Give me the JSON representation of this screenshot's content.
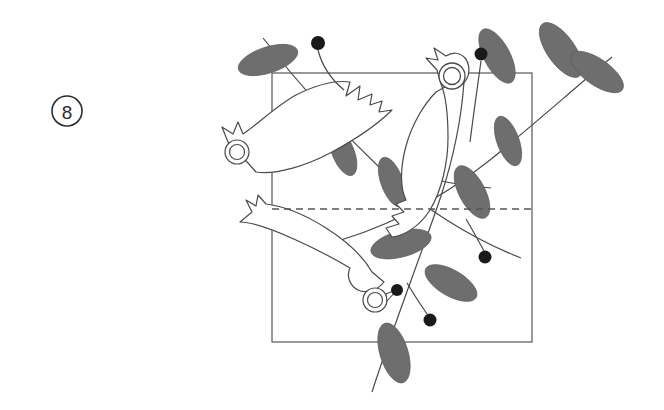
{
  "figure": {
    "label": {
      "name": "figure-number-badge",
      "text": "8",
      "shape": "circle-outline",
      "cx": 67,
      "cy": 111,
      "r": 15
    },
    "background_color": "#ffffff",
    "stroke_color": "#4a4a4a",
    "leaf_fill_color": "#6e6e6e",
    "berry_fill_color": "#1a1a1a",
    "frame_color": "#555555",
    "dashed_color": "#555555",
    "caption": "",
    "title": ""
  },
  "frame": {
    "name": "square-frame",
    "x": 272,
    "y": 73,
    "width": 260,
    "height": 269
  },
  "fold_line": {
    "name": "horizontal-dashed-fold-line",
    "y": 209,
    "x_start": 272,
    "x_end": 532,
    "style": "dashed"
  },
  "birds": [
    {
      "name": "bird-upper-left",
      "eye_cx": 237,
      "eye_cy": 152,
      "eye_r_outer": 12,
      "eye_r_inner": 7.5,
      "orientation": "head-lower-left"
    },
    {
      "name": "bird-upper-right",
      "eye_cx": 452,
      "eye_cy": 76,
      "eye_r_outer": 13,
      "eye_r_inner": 8.5,
      "orientation": "head-upper"
    },
    {
      "name": "bird-lower-center",
      "eye_cx": 375,
      "eye_cy": 300,
      "eye_r_outer": 12,
      "eye_r_inner": 7.5,
      "orientation": "head-lower-right"
    }
  ],
  "leaves": [
    {
      "name": "leaf-top-left",
      "cx": 268,
      "cy": 60,
      "rx": 31,
      "ry": 13,
      "rot": -18
    },
    {
      "name": "leaf-top-right-a",
      "cx": 497,
      "cy": 56,
      "rx": 30,
      "ry": 13,
      "rot": 62
    },
    {
      "name": "leaf-top-right-b",
      "cx": 561,
      "cy": 50,
      "rx": 32,
      "ry": 14,
      "rot": 55
    },
    {
      "name": "leaf-top-right-c",
      "cx": 597,
      "cy": 72,
      "rx": 31,
      "ry": 13,
      "rot": 35
    },
    {
      "name": "leaf-mid-left",
      "cx": 343,
      "cy": 152,
      "rx": 25,
      "ry": 11,
      "rot": 68
    },
    {
      "name": "leaf-mid-center",
      "cx": 392,
      "cy": 182,
      "rx": 26,
      "ry": 11,
      "rot": 70
    },
    {
      "name": "leaf-mid-right",
      "cx": 508,
      "cy": 141,
      "rx": 26,
      "ry": 11,
      "rot": 70
    },
    {
      "name": "leaf-center-right",
      "cx": 472,
      "cy": 192,
      "rx": 29,
      "ry": 13,
      "rot": 62
    },
    {
      "name": "leaf-lower-center",
      "cx": 401,
      "cy": 244,
      "rx": 31,
      "ry": 13,
      "rot": -15
    },
    {
      "name": "leaf-lower-right",
      "cx": 451,
      "cy": 283,
      "rx": 29,
      "ry": 13,
      "rot": 30
    },
    {
      "name": "leaf-bottom",
      "cx": 394,
      "cy": 353,
      "rx": 31,
      "ry": 14,
      "rot": 73
    }
  ],
  "berries": [
    {
      "name": "berry-top-left",
      "cx": 318,
      "cy": 43,
      "r": 7,
      "stem_to_x": 344,
      "stem_to_y": 88
    },
    {
      "name": "berry-top-right",
      "cx": 481,
      "cy": 54,
      "r": 6.5,
      "stem_to_x": 470,
      "stem_to_y": 140
    },
    {
      "name": "berry-mid-right",
      "cx": 485,
      "cy": 257,
      "r": 6.5,
      "stem_to_x": 466,
      "stem_to_y": 219
    },
    {
      "name": "berry-lower",
      "cx": 430,
      "cy": 320,
      "r": 6.5,
      "stem_to_x": 408,
      "stem_to_y": 283
    },
    {
      "name": "berry-beak-dot",
      "cx": 397,
      "cy": 290,
      "r": 6,
      "stem_to_x": 397,
      "stem_to_y": 290
    }
  ],
  "branches": [
    {
      "name": "branch-main-upper-right"
    },
    {
      "name": "branch-diagonal-descending"
    },
    {
      "name": "branch-through-lower-bird"
    }
  ]
}
